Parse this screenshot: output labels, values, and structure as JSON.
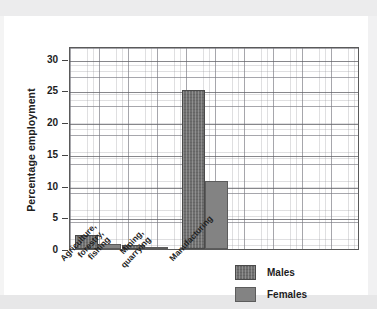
{
  "chart_data": {
    "type": "bar",
    "title": "",
    "xlabel": "",
    "ylabel": "Percentage employment",
    "ylim": [
      0,
      32
    ],
    "yticks": [
      0,
      5,
      10,
      15,
      20,
      25,
      30
    ],
    "grid": true,
    "legend_position": "bottom-right",
    "categories": [
      "Agriculture,\nforestry,\nfishing",
      "Mining,\nquarrying",
      "Manufacturing"
    ],
    "category_labels": [
      [
        "Agriculture,",
        "forestry,",
        "fishing"
      ],
      [
        "Mining,",
        "quarrying"
      ],
      [
        "Manufacturing"
      ]
    ],
    "series": [
      {
        "name": "Males",
        "color": "#6f6f6f",
        "values": [
          2.2,
          0.6,
          25.1
        ]
      },
      {
        "name": "Females",
        "color": "#838383",
        "values": [
          0.8,
          0.2,
          10.8
        ]
      }
    ]
  },
  "axis": {
    "y_title": "Percentage employment",
    "tick_labels": [
      "30",
      "25",
      "20",
      "15",
      "10",
      "5",
      "0"
    ]
  },
  "legend": {
    "items": [
      {
        "label": "Males"
      },
      {
        "label": "Females"
      }
    ]
  }
}
